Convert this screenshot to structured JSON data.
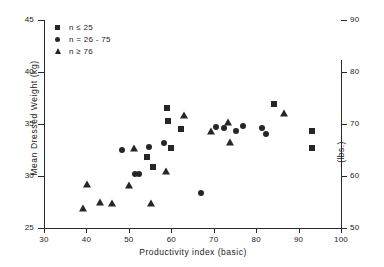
{
  "chart_data": {
    "type": "scatter",
    "title": "",
    "xlabel": "Productivity index (basic)",
    "ylabel": "Mean Dressed Weight (kg)",
    "ylabel_secondary": "(lbs.)",
    "xlim": [
      30,
      100
    ],
    "ylim": [
      25,
      45
    ],
    "ylim_secondary": [
      50,
      90
    ],
    "xticks": [
      30,
      40,
      50,
      60,
      70,
      80,
      90,
      100
    ],
    "yticks": [
      25,
      30,
      35,
      40,
      45
    ],
    "yticks_secondary": [
      50,
      60,
      70,
      80,
      90
    ],
    "grid": false,
    "legend_position": "top-left",
    "marker_color": "#262626",
    "series": [
      {
        "name": "n ≤ 25",
        "marker": "square",
        "points": [
          [
            59.0,
            36.5
          ],
          [
            59.2,
            35.3
          ],
          [
            54.3,
            31.8
          ],
          [
            55.8,
            30.9
          ],
          [
            60.0,
            32.7
          ],
          [
            62.3,
            34.5
          ],
          [
            84.3,
            36.9
          ],
          [
            93.2,
            34.3
          ],
          [
            93.1,
            32.7
          ]
        ]
      },
      {
        "name": "n = 26 - 75",
        "marker": "circle",
        "points": [
          [
            48.4,
            32.5
          ],
          [
            51.5,
            30.2
          ],
          [
            52.3,
            30.2
          ],
          [
            54.7,
            32.8
          ],
          [
            58.3,
            33.2
          ],
          [
            67.0,
            28.4
          ],
          [
            70.6,
            34.7
          ],
          [
            72.4,
            34.6
          ],
          [
            75.2,
            34.3
          ],
          [
            77.0,
            34.8
          ],
          [
            81.3,
            34.6
          ],
          [
            82.4,
            34.0
          ]
        ]
      },
      {
        "name": "n ≥ 76",
        "marker": "triangle",
        "points": [
          [
            39.2,
            26.9
          ],
          [
            40.1,
            29.2
          ],
          [
            43.2,
            27.5
          ],
          [
            46.1,
            27.4
          ],
          [
            50.1,
            29.1
          ],
          [
            51.2,
            32.7
          ],
          [
            55.2,
            27.4
          ],
          [
            58.7,
            30.5
          ],
          [
            62.9,
            35.9
          ],
          [
            69.4,
            34.3
          ],
          [
            73.3,
            35.2
          ],
          [
            73.8,
            33.3
          ],
          [
            86.6,
            36.1
          ]
        ]
      }
    ]
  },
  "legend": {
    "items": [
      {
        "label": "n ≤ 25",
        "marker": "square"
      },
      {
        "label": "n = 26 - 75",
        "marker": "circle"
      },
      {
        "label": "n ≥ 76",
        "marker": "triangle"
      }
    ]
  }
}
